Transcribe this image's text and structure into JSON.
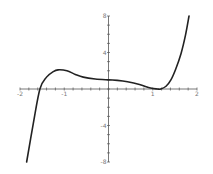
{
  "chart_data": {
    "type": "line",
    "title": "",
    "xlabel": "",
    "ylabel": "",
    "xlim": [
      -2,
      2
    ],
    "ylim": [
      -8,
      8
    ],
    "grid": false,
    "legend": null,
    "x_ticks": [
      -2,
      -1,
      1,
      2
    ],
    "x_tick_labels": [
      "-2",
      "-1",
      "1",
      "2"
    ],
    "y_ticks": [
      8,
      4,
      -4,
      -8
    ],
    "y_tick_labels": [
      "8",
      "4",
      "-4",
      "-8"
    ],
    "series": [
      {
        "name": "f(x)",
        "color": "#222222",
        "x": [
          -1.85,
          -1.7,
          -1.55,
          -1.4,
          -1.25,
          -1.14,
          -0.94,
          -0.75,
          -0.57,
          -0.3,
          0.0,
          0.2,
          0.43,
          0.7,
          0.95,
          1.1,
          1.18,
          1.3,
          1.41,
          1.52,
          1.64,
          1.74,
          1.82
        ],
        "y": [
          -8.0,
          -3.8,
          0.0,
          1.3,
          1.9,
          2.1,
          2.0,
          1.6,
          1.3,
          1.1,
          1.0,
          0.95,
          0.8,
          0.5,
          0.1,
          0.0,
          0.0,
          0.3,
          1.0,
          2.2,
          3.9,
          5.9,
          8.0
        ]
      }
    ]
  }
}
